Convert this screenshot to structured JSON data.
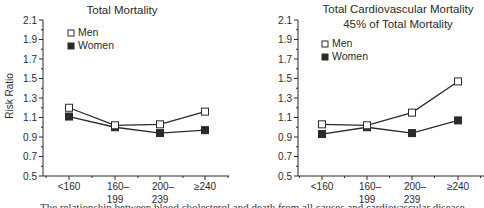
{
  "figure": {
    "ylabel": "Risk Ratio",
    "caption": "The relationship between blood cholesterol and death from all causes and cardiovascular disease"
  },
  "chart_data": [
    {
      "type": "line",
      "title": "Total Mortality",
      "subtitle": "",
      "xlabel": "",
      "ylabel": "Risk Ratio",
      "categories": [
        "<160",
        "160–199",
        "200–239",
        "≥240"
      ],
      "category_lines": [
        [
          "<160"
        ],
        [
          "160–",
          "199"
        ],
        [
          "200–",
          "239"
        ],
        [
          "≥240"
        ]
      ],
      "yticks": [
        0.5,
        0.7,
        0.9,
        1.1,
        1.3,
        1.5,
        1.7,
        1.9,
        2.1
      ],
      "ylim": [
        0.5,
        2.1
      ],
      "grid": false,
      "legend_position": "upper-left",
      "series": [
        {
          "name": "Men",
          "marker": "open-square",
          "values": [
            1.2,
            1.02,
            1.03,
            1.16
          ]
        },
        {
          "name": "Women",
          "marker": "filled-square",
          "values": [
            1.11,
            1.0,
            0.94,
            0.97
          ]
        }
      ]
    },
    {
      "type": "line",
      "title": "Total Cardiovascular Mortality",
      "subtitle": "45% of Total Mortality",
      "xlabel": "",
      "ylabel": "",
      "categories": [
        "<160",
        "160–199",
        "200–239",
        "≥240"
      ],
      "category_lines": [
        [
          "<160"
        ],
        [
          "160–",
          "199"
        ],
        [
          "200–",
          "239"
        ],
        [
          "≥240"
        ]
      ],
      "yticks": [
        0.5,
        0.7,
        0.9,
        1.1,
        1.3,
        1.5,
        1.7,
        1.9,
        2.1
      ],
      "ylim": [
        0.5,
        2.1
      ],
      "grid": false,
      "legend_position": "upper-left",
      "series": [
        {
          "name": "Men",
          "marker": "open-square",
          "values": [
            1.03,
            1.02,
            1.15,
            1.47
          ]
        },
        {
          "name": "Women",
          "marker": "filled-square",
          "values": [
            0.93,
            1.0,
            0.94,
            1.07
          ]
        }
      ]
    }
  ],
  "colors": {
    "ink": "#2a2a2a",
    "background": "#ffffff"
  }
}
